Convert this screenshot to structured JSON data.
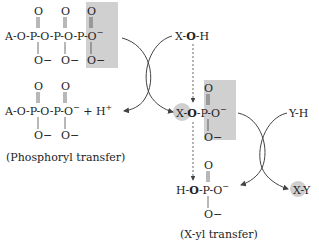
{
  "diagram": {
    "atp": {
      "chain": [
        "A-O-P-O-P-O-P-O",
        "−"
      ],
      "oxo_top": [
        "O",
        "O",
        "O"
      ],
      "anions_bottom": [
        "O−",
        "O−",
        "O−"
      ]
    },
    "nucleophile": {
      "x": "X",
      "o": "O",
      "h": "H"
    },
    "adp": {
      "chain": "A-O-P-O-P-O",
      "minus": "−",
      "plus_h": "+ H",
      "plus_sup": "+",
      "oxo_top": [
        "O",
        "O"
      ],
      "anions_bottom": [
        "O−",
        "O−"
      ]
    },
    "phosphoryl_label": "(Phosphoryl transfer)",
    "intermediate": {
      "x": "X",
      "o": "O",
      "rest": "-P-O",
      "minus": "−",
      "oxo_top": "O",
      "anion_bottom": "O−"
    },
    "second_nucleophile": "Y-H",
    "phosphate": {
      "h": "H-",
      "o": "O",
      "rest": "-P-O",
      "minus": "−",
      "oxo_top": "O",
      "anion_bottom": "O−"
    },
    "product": "X-Y",
    "xyl_label": "(X-yl transfer)",
    "colors": {
      "highlight": "#d0d0d0",
      "line": "#444444"
    }
  }
}
